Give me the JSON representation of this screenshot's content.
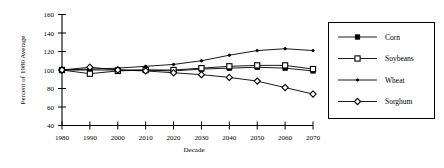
{
  "chart_data": {
    "type": "line",
    "title": "",
    "xlabel": "Decade",
    "ylabel": "Percent of 1980 Average",
    "x": [
      1980,
      1990,
      2000,
      2010,
      2020,
      2030,
      2040,
      2050,
      2060,
      2070
    ],
    "xtick_labels": [
      "1980",
      "1990",
      "2000",
      "2010",
      "2020",
      "2030",
      "2040",
      "2050",
      "2060",
      "2070"
    ],
    "ytick_labels": [
      "40",
      "60",
      "80",
      "100",
      "120",
      "140",
      "160"
    ],
    "ylim": [
      40,
      160
    ],
    "xlim": [
      1980,
      2070
    ],
    "grid": false,
    "legend_position": "right-outside",
    "series": [
      {
        "name": "Corn",
        "marker": "filled-square",
        "values": [
          100,
          100,
          100,
          100,
          99,
          101,
          102,
          103,
          102,
          99
        ]
      },
      {
        "name": "Soybeans",
        "marker": "open-square",
        "values": [
          100,
          96,
          99,
          100,
          100,
          102,
          104,
          105,
          105,
          101
        ]
      },
      {
        "name": "Wheat",
        "marker": "small-dot",
        "values": [
          100,
          101,
          102,
          104,
          106,
          110,
          116,
          121,
          123,
          121
        ]
      },
      {
        "name": "Sorghum",
        "marker": "open-diamond",
        "values": [
          100,
          103,
          100,
          99,
          97,
          95,
          92,
          88,
          81,
          74
        ]
      }
    ]
  },
  "legend": {
    "entries": [
      {
        "label": "Corn"
      },
      {
        "label": "Soybeans"
      },
      {
        "label": "Wheat"
      },
      {
        "label": "Sorghum"
      }
    ]
  }
}
